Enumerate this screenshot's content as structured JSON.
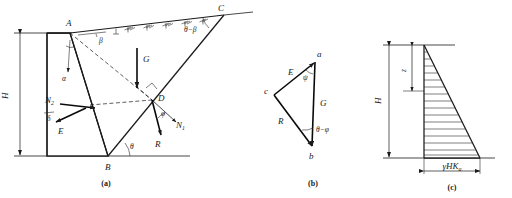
{
  "figure": {
    "captions": {
      "a": "(a)",
      "b": "(b)",
      "c": "(c)"
    }
  },
  "panel_a": {
    "name": "retaining wall failure wedge",
    "points": {
      "A": "A",
      "B": "B",
      "C": "C",
      "D": "D",
      "E": "E"
    },
    "angles": {
      "alpha": "α",
      "beta": "β",
      "theta": "θ",
      "delta": "δ",
      "phi": "φ",
      "theta_minus_beta": "θ−β"
    },
    "forces": {
      "G": "G",
      "R": "R",
      "N1": "N",
      "N1_sub": "1",
      "N2": "N",
      "N2_sub": "2"
    },
    "dimensions": {
      "H": "H"
    }
  },
  "panel_b": {
    "name": "force triangle",
    "vertices": {
      "a": "a",
      "b": "b",
      "c": "c"
    },
    "sides": {
      "E": "E",
      "G": "G",
      "R": "R"
    },
    "angles": {
      "psi": "ψ",
      "theta_minus_phi": "θ−φ"
    }
  },
  "panel_c": {
    "name": "earth pressure distribution",
    "dimensions": {
      "H": "H",
      "z": "z"
    },
    "labels": {
      "base_pressure": "γHK",
      "base_pressure_sub": "a"
    },
    "hatch_line_count": 16
  },
  "colors": {
    "ink": "#1a1a1a",
    "paper": "#ffffff"
  }
}
